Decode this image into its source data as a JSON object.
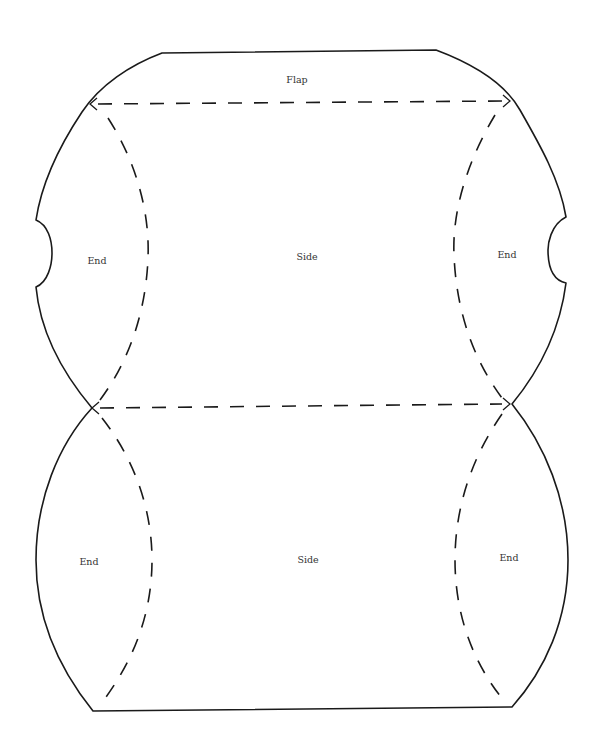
{
  "diagram": {
    "type": "pillow-box-template",
    "colors": {
      "line": "#1a1a1a",
      "text": "#333333",
      "background": "#ffffff"
    },
    "labels": {
      "flap": "Flap",
      "top_side": "Side",
      "top_left_end": "End",
      "top_right_end": "End",
      "bottom_side": "Side",
      "bottom_left_end": "End",
      "bottom_right_end": "End"
    },
    "legend": {
      "solid_line": "cut-line",
      "dashed_line": "fold-line"
    }
  }
}
